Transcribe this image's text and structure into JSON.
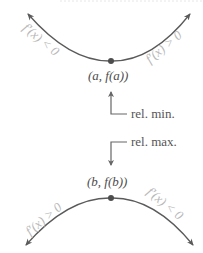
{
  "diagram": {
    "colors": {
      "curve": "#5a5a5a",
      "point": "#4d4d4d",
      "derivative_label": "#b8b8b8",
      "pointer": "#666666",
      "top_rule": "#e6e6e6"
    },
    "minimum": {
      "point_label": "(a, f(a))",
      "left_derivative": "f′(x) < 0",
      "right_derivative": "f′(x) > 0",
      "annotation": "rel. min."
    },
    "maximum": {
      "point_label": "(b, f(b))",
      "left_derivative": "f′(x) > 0",
      "right_derivative": "f′(x) < 0",
      "annotation": "rel. max."
    }
  }
}
